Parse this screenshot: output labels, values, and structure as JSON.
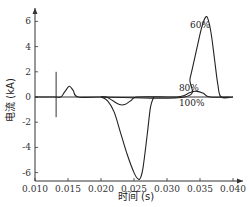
{
  "chart_data": {
    "type": "line",
    "title": "",
    "xlabel": "时间 (s)",
    "ylabel": "电流 (kA)",
    "xlim": [
      0.01,
      0.041
    ],
    "ylim": [
      -6.5,
      7.0
    ],
    "xticks": [
      0.01,
      0.015,
      0.02,
      0.025,
      0.03,
      0.035,
      0.04
    ],
    "xtick_labels": [
      "0.010",
      "0.015",
      "0.020",
      "0.025",
      "0.030",
      "0.035",
      "0.040"
    ],
    "yticks": [
      -6,
      -4,
      -2,
      0,
      2,
      4,
      6
    ],
    "ytick_labels": [
      "-6",
      "-4",
      "-2",
      "0",
      "2",
      "4",
      "6"
    ],
    "grid": false,
    "marker_line_x": 0.0132,
    "series": [
      {
        "name": "60%",
        "x": [
          0.01,
          0.013,
          0.0139,
          0.0145,
          0.0152,
          0.0158,
          0.0165,
          0.02,
          0.0327,
          0.0335,
          0.0345,
          0.0352,
          0.0358,
          0.0362,
          0.0367,
          0.0372,
          0.0377,
          0.0382,
          0.04
        ],
        "y": [
          0,
          0,
          0,
          0.4,
          0.85,
          0.5,
          0,
          0,
          0,
          1.5,
          3.8,
          5.4,
          6.3,
          6.2,
          5.0,
          3.0,
          1.0,
          0,
          0
        ]
      },
      {
        "name": "80%",
        "x": [
          0.02,
          0.0208,
          0.0218,
          0.0228,
          0.0236,
          0.0245,
          0.0255,
          0.03,
          0.0315,
          0.0325,
          0.0335,
          0.0345,
          0.0355,
          0.0365,
          0.04
        ],
        "y": [
          0,
          0,
          -0.3,
          -0.6,
          -0.6,
          -0.3,
          0,
          0,
          0,
          0.1,
          0.35,
          0.45,
          0.3,
          0,
          0
        ]
      },
      {
        "name": "100%",
        "x": [
          0.02,
          0.021,
          0.022,
          0.023,
          0.024,
          0.025,
          0.0256,
          0.026,
          0.0264,
          0.027,
          0.0275,
          0.028
        ],
        "y": [
          0,
          -0.3,
          -1.2,
          -2.9,
          -4.6,
          -6.0,
          -6.5,
          -6.4,
          -5.5,
          -3.0,
          -0.8,
          0
        ]
      }
    ],
    "annotations": [
      {
        "text": "60%",
        "x": 0.0335,
        "y": 5.5
      },
      {
        "text": "80%",
        "x": 0.0318,
        "y": 0.45
      },
      {
        "text": "100%",
        "x": 0.0318,
        "y": -0.75
      }
    ]
  }
}
